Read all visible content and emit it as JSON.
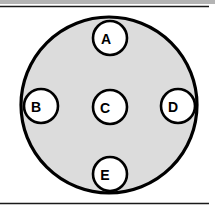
{
  "figure": {
    "width": 215,
    "height": 213,
    "background_color": "#ffffff"
  },
  "top_band": {
    "name": "top-gray-band",
    "color": "#b4b4b4",
    "x": 0,
    "y": 0,
    "width": 215,
    "height": 4
  },
  "rules": [
    {
      "name": "top-rule",
      "x1": 0,
      "y1": 6.5,
      "x2": 209,
      "y2": 6.5,
      "color": "#1a1a1a",
      "width": 1.6
    },
    {
      "name": "bottom-rule",
      "x1": 0,
      "y1": 203.5,
      "x2": 209,
      "y2": 203.5,
      "color": "#1a1a1a",
      "width": 1.6
    }
  ],
  "outer_circle": {
    "name": "outer-circle",
    "cx": 109,
    "cy": 105,
    "r": 88,
    "fill": "#dcdcdc",
    "stroke": "#000000",
    "stroke_width": 3.2
  },
  "nodes": [
    {
      "id": "A",
      "label": "A",
      "cx": 110,
      "cy": 38,
      "r": 17,
      "fill": "#ffffff",
      "stroke": "#000000",
      "stroke_width": 2.6,
      "label_dx": -4
    },
    {
      "id": "B",
      "label": "B",
      "cx": 41,
      "cy": 106,
      "r": 17,
      "fill": "#ffffff",
      "stroke": "#000000",
      "stroke_width": 2.6,
      "label_dx": -5
    },
    {
      "id": "C",
      "label": "C",
      "cx": 110,
      "cy": 107,
      "r": 17,
      "fill": "#ffffff",
      "stroke": "#000000",
      "stroke_width": 2.6,
      "label_dx": -5
    },
    {
      "id": "D",
      "label": "D",
      "cx": 178,
      "cy": 106,
      "r": 17,
      "fill": "#ffffff",
      "stroke": "#000000",
      "stroke_width": 2.6,
      "label_dx": -5
    },
    {
      "id": "E",
      "label": "E",
      "cx": 110,
      "cy": 174,
      "r": 17,
      "fill": "#ffffff",
      "stroke": "#000000",
      "stroke_width": 2.6,
      "label_dx": -5
    }
  ]
}
